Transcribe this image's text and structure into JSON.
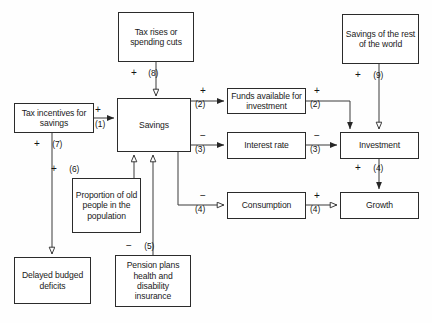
{
  "diagram": {
    "canvas": {
      "width": 432,
      "height": 323
    },
    "colors": {
      "background": "#fefefe",
      "box_border": "#2b2b2b",
      "box_fill": "#ffffff",
      "line": "#3a3a3a",
      "text": "#1a1a1a"
    },
    "nodes": [
      {
        "id": "tax_rises",
        "label": "Tax rises or spending cuts",
        "x": 118,
        "y": 12,
        "w": 76,
        "h": 50
      },
      {
        "id": "savings_row",
        "label": "Savings of the rest of the world",
        "x": 342,
        "y": 14,
        "w": 77,
        "h": 50
      },
      {
        "id": "tax_incentives",
        "label": "Tax incentives for savings",
        "x": 14,
        "y": 103,
        "w": 80,
        "h": 30
      },
      {
        "id": "savings",
        "label": "Savings",
        "x": 117,
        "y": 98,
        "w": 74,
        "h": 54
      },
      {
        "id": "funds",
        "label": "Funds available for investment",
        "x": 227,
        "y": 88,
        "w": 79,
        "h": 26
      },
      {
        "id": "interest_rate",
        "label": "Interest rate",
        "x": 227,
        "y": 132,
        "w": 79,
        "h": 27
      },
      {
        "id": "investment",
        "label": "Investment",
        "x": 340,
        "y": 132,
        "w": 79,
        "h": 27
      },
      {
        "id": "consumption",
        "label": "Consumption",
        "x": 227,
        "y": 192,
        "w": 79,
        "h": 27
      },
      {
        "id": "growth",
        "label": "Growth",
        "x": 340,
        "y": 192,
        "w": 79,
        "h": 27
      },
      {
        "id": "proportion_old",
        "label": "Proportion of old people in the population",
        "x": 72,
        "y": 178,
        "w": 69,
        "h": 55
      },
      {
        "id": "delayed",
        "label": "Delayed budged deficits",
        "x": 14,
        "y": 257,
        "w": 77,
        "h": 47
      },
      {
        "id": "pension",
        "label": "Pension plans health and disability insurance",
        "x": 115,
        "y": 255,
        "w": 76,
        "h": 52
      }
    ],
    "edges": [
      {
        "id": "e8",
        "from": "tax_rises",
        "to": "savings",
        "sign": "+",
        "number": "(8)",
        "arrow": "hollow",
        "label_x": 131,
        "label_y": 68
      },
      {
        "id": "e1",
        "from": "tax_incentives",
        "to": "savings",
        "sign": "+",
        "number": "(1)",
        "arrow": "filled",
        "label_x": 95,
        "label_y": 110
      },
      {
        "id": "e7",
        "from": "tax_incentives",
        "to": "delayed",
        "sign": "+",
        "number": "(7)",
        "arrow": "hollow",
        "label_x": 34,
        "label_y": 139
      },
      {
        "id": "e6",
        "from": "proportion_old",
        "to": "savings",
        "sign": "+",
        "number": "(6)",
        "arrow": "hollow",
        "label_x": 51,
        "label_y": 164
      },
      {
        "id": "e5",
        "from": "pension",
        "to": "savings",
        "sign": "−",
        "number": "(5)",
        "arrow": "hollow",
        "label_x": 126,
        "label_y": 241
      },
      {
        "id": "e2a",
        "from": "savings",
        "to": "funds",
        "sign": "+",
        "number": "(2)",
        "arrow": "filled",
        "label_x": 196,
        "label_y": 84
      },
      {
        "id": "e3a",
        "from": "savings",
        "to": "interest_rate",
        "sign": "−",
        "number": "(3)",
        "arrow": "filled",
        "label_x": 196,
        "label_y": 129
      },
      {
        "id": "e4a",
        "from": "savings",
        "to": "consumption",
        "sign": "−",
        "number": "(4)",
        "arrow": "hollow",
        "label_x": 196,
        "label_y": 189
      },
      {
        "id": "e2b",
        "from": "funds",
        "to": "investment",
        "sign": "+",
        "number": "(2)",
        "arrow": "filled",
        "label_x": 311,
        "label_y": 84
      },
      {
        "id": "e3b",
        "from": "interest_rate",
        "to": "investment",
        "sign": "−",
        "number": "(3)",
        "arrow": "filled",
        "label_x": 311,
        "label_y": 129
      },
      {
        "id": "e4b",
        "from": "consumption",
        "to": "growth",
        "sign": "+",
        "number": "(4)",
        "arrow": "hollow",
        "label_x": 311,
        "label_y": 189
      },
      {
        "id": "e9",
        "from": "savings_row",
        "to": "investment",
        "sign": "+",
        "number": "(9)",
        "arrow": "hollow",
        "label_x": 355,
        "label_y": 70
      },
      {
        "id": "e4c",
        "from": "investment",
        "to": "growth",
        "sign": "+",
        "number": "(4)",
        "arrow": "filled",
        "label_x": 355,
        "label_y": 163
      }
    ]
  }
}
